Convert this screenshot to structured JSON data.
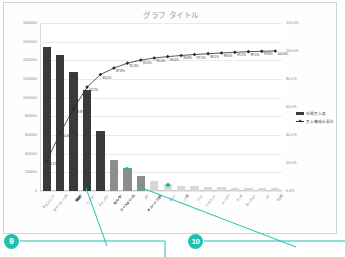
{
  "chart_data": {
    "type": "bar",
    "title": "グラフ タイトル",
    "xlabel": "",
    "ylabel": "",
    "grid": true,
    "legend_position": "right",
    "ylim": [
      0,
      1800000
    ],
    "y2lim": [
      0,
      1.2
    ],
    "yticks": [
      "1800000",
      "1600000",
      "1400000",
      "1200000",
      "1000000",
      "800000",
      "600000",
      "400000",
      "200000",
      "0"
    ],
    "y2ticks": [
      "120.0%",
      "100.0%",
      "80.0%",
      "60.0%",
      "40.0%",
      "20.0%",
      "0.0%"
    ],
    "categories": [
      "チョコレート",
      "ポテトチップス",
      "飲料水",
      "クッキー",
      "キャンディ",
      "せんべい",
      "アイスクリーム",
      "グミ",
      "チューインガム",
      "ゼリー",
      "ナッツ類",
      "プリン",
      "ビスケット",
      "ドーナツ",
      "ケーキ",
      "ヨーグルト",
      "パイ",
      "その他"
    ],
    "series": [
      {
        "name": "年間売上高",
        "type": "bar",
        "values": [
          1540000,
          1460000,
          1270000,
          1080000,
          640000,
          330000,
          250000,
          160000,
          105000,
          72000,
          58000,
          50000,
          44000,
          40000,
          36000,
          33000,
          30000,
          28000
        ]
      },
      {
        "name": "売上構成比累計",
        "type": "line",
        "axis": "secondary",
        "values": [
          0.212,
          0.414,
          0.588,
          0.742,
          0.832,
          0.878,
          0.913,
          0.935,
          0.95,
          0.96,
          0.968,
          0.975,
          0.981,
          0.986,
          0.991,
          0.995,
          0.998,
          1.0
        ],
        "labels": [
          "21.2%",
          "41.4%",
          "58.8%",
          "74.2%",
          "83.2%",
          "87.8%",
          "91.3%",
          "93.5%",
          "95.0%",
          "96.0%",
          "96.8%",
          "97.5%",
          "98.1%",
          "98.6%",
          "99.1%",
          "99.5%",
          "99.8%",
          "100.0%"
        ]
      }
    ],
    "legend": [
      "年間売上高",
      "売上構成比累計"
    ],
    "highlight_color": "#19b6a8",
    "bar_color_primary": "#3a3a3a",
    "bar_color_secondary": "#8d8d8d",
    "bar_color_tertiary": "#d8d8d8"
  },
  "annotations": {
    "accent_color": "#1fc0b0",
    "callouts": [
      {
        "number": "9"
      },
      {
        "number": "10"
      }
    ]
  }
}
